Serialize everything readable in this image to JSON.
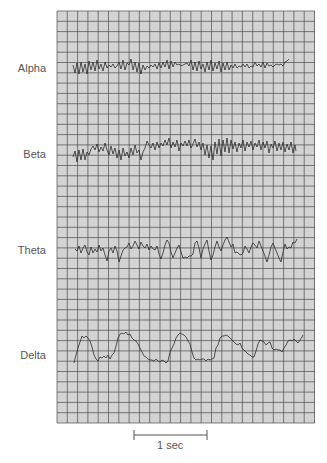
{
  "figure": {
    "grid": {
      "left": 57,
      "top": 11,
      "right": 315,
      "bottom": 423,
      "cell": 10.3,
      "fill": "#d3d3d3",
      "line": "#4a4a4a"
    },
    "trace_color": "#2b2b2b",
    "waves": [
      {
        "name": "Alpha",
        "label_y": 68
      },
      {
        "name": "Beta",
        "label_y": 154
      },
      {
        "name": "Theta",
        "label_y": 250
      },
      {
        "name": "Delta",
        "label_y": 355
      }
    ],
    "scale_bar": {
      "label": "1 sec",
      "x1": 134,
      "x2": 207,
      "y": 435
    }
  }
}
